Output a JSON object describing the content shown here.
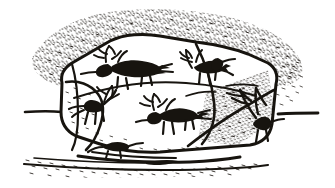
{
  "illustration": {
    "title": "Petroglyph boulder with engraved antlered animals",
    "medium": "pen-and-ink line drawing",
    "palette": {
      "ink": "#17140f",
      "paper": "#ffffff",
      "stipple": "#2b2722"
    },
    "scene": {
      "background_label": "stippled hillside",
      "horizon_label": "horizon line",
      "ground_label": "stippled ground",
      "boulder_label": "engraved boulder",
      "boulder_top_facet_label": "upper boulder facet",
      "boulder_lower_facet_label": "lower boulder facet",
      "boulder_right_facet_label": "right boulder facet",
      "boulder_left_facet_label": "left boulder facet",
      "base_stone_label": "small stone at base"
    },
    "figures": [
      {
        "id": "figure-1",
        "label": "antlered animal facing right",
        "position": "upper left of boulder",
        "facing": "right",
        "antlers": true,
        "legs": 4
      },
      {
        "id": "figure-2",
        "label": "antlered animal facing right",
        "position": "upper right of boulder",
        "facing": "right",
        "antlers": true,
        "legs": 4
      },
      {
        "id": "figure-3",
        "label": "antlered animal facing right",
        "position": "lower center of boulder",
        "facing": "right",
        "antlers": true,
        "legs": 4
      },
      {
        "id": "figure-4",
        "label": "antlered animal facing left",
        "position": "left edge of boulder",
        "facing": "left",
        "antlers": true,
        "legs": 4
      },
      {
        "id": "figure-5",
        "label": "antlered animal oriented vertically",
        "position": "right edge of boulder",
        "facing": "down",
        "antlers": true,
        "legs": 4
      },
      {
        "id": "figure-6",
        "label": "small antlered animal at boulder base",
        "position": "bottom center of boulder",
        "facing": "right",
        "antlers": true,
        "legs": 2
      }
    ]
  }
}
